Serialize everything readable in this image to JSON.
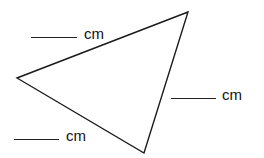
{
  "diagram": {
    "type": "triangle",
    "vertices": [
      [
        188,
        12
      ],
      [
        17,
        78
      ],
      [
        144,
        153
      ]
    ],
    "stroke_color": "#1a1a1a"
  },
  "labels": [
    {
      "unit": "cm",
      "side": "top-left"
    },
    {
      "unit": "cm",
      "side": "right"
    },
    {
      "unit": "cm",
      "side": "bottom-left"
    }
  ]
}
